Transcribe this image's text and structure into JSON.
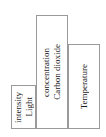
{
  "chart_data": {
    "type": "bar",
    "title": "",
    "subtitle": "",
    "xlabel": "",
    "ylabel": "",
    "orientation": "vertical",
    "grid": false,
    "legend": null,
    "axes_visible": false,
    "tick_labels": [],
    "categories": [
      "Light intensity",
      "Carbon dioxide concentration",
      "Temperature"
    ],
    "values": [
      44,
      114,
      85
    ],
    "ylim": [
      0,
      120
    ],
    "bar_style": {
      "fill": "#ffffff",
      "border": "#9a9a9a",
      "label_color": "#1a1a1a",
      "label_rotation_deg": 90
    },
    "bars": [
      {
        "id": "light",
        "value": 44,
        "label_lines": [
          "Light",
          "intensity"
        ],
        "full_label": "Light intensity"
      },
      {
        "id": "co2",
        "value": 114,
        "label_lines": [
          "Carbon dioxide",
          "concentration"
        ],
        "full_label": "Carbon dioxide concentration"
      },
      {
        "id": "temperature",
        "value": 85,
        "label_lines": [
          "Temperature"
        ],
        "full_label": "Temperature"
      }
    ]
  }
}
